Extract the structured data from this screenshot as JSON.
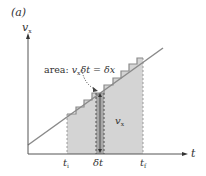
{
  "panel_label": "(a)",
  "axes": {
    "y_label": "v",
    "y_label_sub": "x",
    "x_label": "t"
  },
  "annotation": {
    "prefix": "area: ",
    "v": "v",
    "v_sub": "x",
    "rest": "δt = δx"
  },
  "strip_label": {
    "v": "v",
    "sub": "x"
  },
  "ticks": [
    {
      "name": "t-initial",
      "main": "t",
      "sub": "i"
    },
    {
      "name": "delta-t",
      "main": "δt",
      "sub": ""
    },
    {
      "name": "t-final",
      "main": "t",
      "sub": "f"
    }
  ],
  "colors": {
    "line": "#8a8a8a",
    "axis": "#555555",
    "shade_light": "#d4d4d4",
    "shade_dark": "#a8a8a8",
    "text": "#333333"
  }
}
